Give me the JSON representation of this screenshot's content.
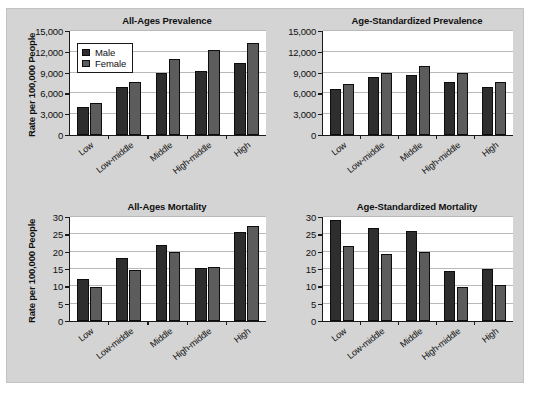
{
  "figure": {
    "background_color": "#d4d4d4",
    "plot_background_color": "#ffffff"
  },
  "legend": {
    "position": "inside-top-left-panel-1",
    "entries": [
      {
        "label": "Male",
        "color": "#2e2e2e"
      },
      {
        "label": "Female",
        "color": "#5c5c5c"
      }
    ]
  },
  "shared": {
    "ylabel": "Rate per 100,000 People",
    "categories": [
      "Low",
      "Low-middle",
      "Middle",
      "High-middle",
      "High"
    ],
    "series_names": [
      "Male",
      "Female"
    ],
    "male_color": "#2e2e2e",
    "female_color": "#5c5c5c"
  },
  "chart_data": [
    {
      "id": "all-ages-prevalence",
      "type": "bar",
      "title": "All-Ages Prevalence",
      "xlabel": "",
      "ylabel": "Rate per 100,000 People",
      "categories": [
        "Low",
        "Low-middle",
        "Middle",
        "High-middle",
        "High"
      ],
      "series": [
        {
          "name": "Male",
          "values": [
            4100,
            6950,
            8950,
            9300,
            10400
          ]
        },
        {
          "name": "Female",
          "values": [
            4550,
            7700,
            11000,
            12300,
            13300
          ]
        }
      ],
      "ylim": [
        0,
        15000
      ],
      "yticks": [
        0,
        3000,
        6000,
        9000,
        12000,
        15000
      ],
      "ytick_labels": [
        "0",
        "3,000",
        "6,000",
        "9,000",
        "12,000",
        "15,000"
      ],
      "grid": true,
      "legend": true
    },
    {
      "id": "age-standardized-prevalence",
      "type": "bar",
      "title": "Age-Standardized Prevalence",
      "xlabel": "",
      "ylabel": "",
      "categories": [
        "Low",
        "Low-middle",
        "Middle",
        "High-middle",
        "High"
      ],
      "series": [
        {
          "name": "Male",
          "values": [
            6700,
            8300,
            8700,
            7600,
            6900
          ]
        },
        {
          "name": "Female",
          "values": [
            7300,
            8900,
            10000,
            8900,
            7600
          ]
        }
      ],
      "ylim": [
        0,
        15000
      ],
      "yticks": [
        0,
        3000,
        6000,
        9000,
        12000,
        15000
      ],
      "ytick_labels": [
        "0",
        "3,000",
        "6,000",
        "9,000",
        "12,000",
        "15,000"
      ],
      "grid": true,
      "legend": false
    },
    {
      "id": "all-ages-mortality",
      "type": "bar",
      "title": "All-Ages Mortality",
      "xlabel": "",
      "ylabel": "Rate per 100,000 People",
      "categories": [
        "Low",
        "Low-middle",
        "Middle",
        "High-middle",
        "High"
      ],
      "series": [
        {
          "name": "Male",
          "values": [
            12.0,
            18.1,
            21.8,
            15.3,
            25.6
          ]
        },
        {
          "name": "Female",
          "values": [
            9.8,
            14.7,
            20.0,
            15.6,
            27.5
          ]
        }
      ],
      "ylim": [
        0,
        30
      ],
      "yticks": [
        0,
        5,
        10,
        15,
        20,
        25,
        30
      ],
      "ytick_labels": [
        "0",
        "5",
        "10",
        "15",
        "20",
        "25",
        "30"
      ],
      "grid": true,
      "legend": false
    },
    {
      "id": "age-standardized-mortality",
      "type": "bar",
      "title": "Age-Standardized Mortality",
      "xlabel": "",
      "ylabel": "",
      "categories": [
        "Low",
        "Low-middle",
        "Middle",
        "High-middle",
        "High"
      ],
      "series": [
        {
          "name": "Male",
          "values": [
            29.2,
            26.7,
            25.9,
            14.4,
            15.0
          ]
        },
        {
          "name": "Female",
          "values": [
            21.6,
            19.3,
            20.0,
            9.8,
            10.3
          ]
        }
      ],
      "ylim": [
        0,
        30
      ],
      "yticks": [
        0,
        5,
        10,
        15,
        20,
        25,
        30
      ],
      "ytick_labels": [
        "0",
        "5",
        "10",
        "15",
        "20",
        "25",
        "30"
      ],
      "grid": true,
      "legend": false
    }
  ]
}
